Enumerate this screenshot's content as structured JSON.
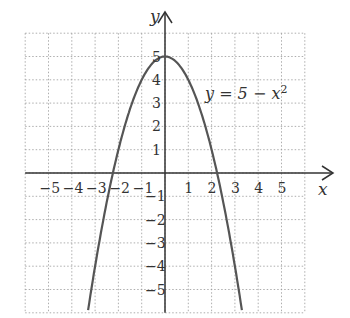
{
  "chart_data": {
    "type": "line",
    "title": "",
    "xlabel": "x",
    "ylabel": "y",
    "xlim": [
      -6,
      6
    ],
    "ylim": [
      -6,
      6
    ],
    "grid": true,
    "x_ticks": [
      "-5",
      "-4",
      "-3",
      "-2",
      "-1",
      "1",
      "2",
      "3",
      "4",
      "5"
    ],
    "y_ticks": [
      "5",
      "4",
      "3",
      "2",
      "1",
      "-1",
      "-2",
      "-3",
      "-4",
      "-5"
    ],
    "annotation": "y = 5 − x²",
    "series": [
      {
        "name": "y = 5 - x^2",
        "function": "5 - x^2",
        "x": [
          -3.3,
          -3,
          -2.5,
          -2,
          -1.5,
          -1,
          -0.5,
          0,
          0.5,
          1,
          1.5,
          2,
          2.5,
          3,
          3.3
        ],
        "y": [
          -5.89,
          -4,
          -1.25,
          1,
          2.75,
          4,
          4.75,
          5,
          4.75,
          4,
          2.75,
          1,
          -1.25,
          -4,
          -5.89
        ]
      }
    ]
  },
  "labels": {
    "x_axis": "x",
    "y_axis": "y",
    "equation": "y = 5 − x",
    "equation_exp": "2"
  }
}
